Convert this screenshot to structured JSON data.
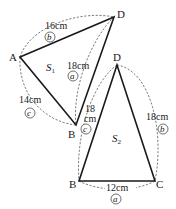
{
  "figure": {
    "triangle_1": {
      "area_label": "S",
      "area_subscript": "1",
      "vertices": {
        "A": {
          "label": "A"
        },
        "D": {
          "label": "D"
        },
        "B": {
          "label": "B"
        }
      },
      "sides": {
        "AD": {
          "length": "16cm",
          "mark": "b"
        },
        "DB": {
          "length": "18cm",
          "mark": "a"
        },
        "AB": {
          "length": "14cm",
          "mark": "c"
        }
      }
    },
    "triangle_2": {
      "area_label": "S",
      "area_subscript": "2",
      "vertices": {
        "D": {
          "label": "D"
        },
        "B": {
          "label": "B"
        },
        "C": {
          "label": "C"
        }
      },
      "sides": {
        "DB": {
          "length_line1": "18",
          "length_line2": "cm",
          "mark": "c"
        },
        "DC": {
          "length": "18cm",
          "mark": "b"
        },
        "BC": {
          "length": "12cm",
          "mark": "a"
        }
      }
    }
  }
}
